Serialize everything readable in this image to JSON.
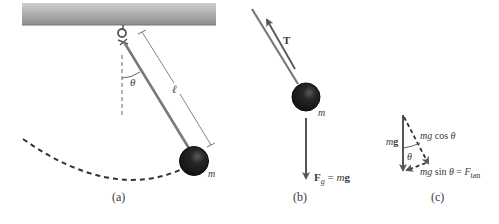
{
  "panels": [
    {
      "id": "a",
      "caption": "(a)",
      "labels": {
        "angle": "θ",
        "length": "ℓ",
        "mass": "m"
      }
    },
    {
      "id": "b",
      "caption": "(b)",
      "labels": {
        "tension": "T",
        "gravity_force": "F",
        "gravity_sub": "g",
        "gravity_eq": " = ",
        "gravity_m": "m",
        "gravity_g": "g",
        "mass": "m"
      }
    },
    {
      "id": "c",
      "caption": "(c)",
      "labels": {
        "weight_m": "m",
        "weight_g": "g",
        "cos_term_mg": "mg",
        "cos_term_fn": " cos ",
        "cos_term_theta": "θ",
        "angle": "θ",
        "sin_term_mg": "mg",
        "sin_term_fn": " sin ",
        "sin_term_theta": "θ",
        "sin_term_eq": " = ",
        "sin_term_F": "F",
        "sin_term_sub": "tan"
      }
    }
  ],
  "colors": {
    "ceiling_top": "#c4c4c4",
    "ceiling_bottom": "#8e8e8e",
    "rod": "#7a7a7a",
    "bob": "#1e1e1e",
    "arrow": "#555555",
    "dash": "#444444"
  }
}
